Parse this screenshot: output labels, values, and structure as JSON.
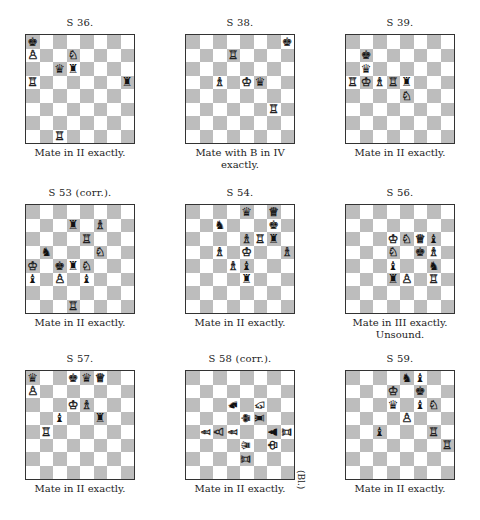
{
  "problems": [
    {
      "id": "s36",
      "title": "S 36.",
      "caption": [
        "Mate in II exactly."
      ],
      "pieces": [
        {
          "sq": "a8",
          "color": "b",
          "type": "K"
        },
        {
          "sq": "a7",
          "color": "w",
          "type": "P"
        },
        {
          "sq": "d7",
          "color": "w",
          "type": "N"
        },
        {
          "sq": "c6",
          "color": "b",
          "type": "Q"
        },
        {
          "sq": "d6",
          "color": "b",
          "type": "R"
        },
        {
          "sq": "a5",
          "color": "w",
          "type": "R"
        },
        {
          "sq": "h5",
          "color": "b",
          "type": "R"
        },
        {
          "sq": "c1",
          "color": "w",
          "type": "R"
        }
      ]
    },
    {
      "id": "s38",
      "title": "S 38.",
      "caption": [
        "Mate with B in IV",
        "exactly."
      ],
      "pieces": [
        {
          "sq": "h8",
          "color": "b",
          "type": "K"
        },
        {
          "sq": "d7",
          "color": "w",
          "type": "R"
        },
        {
          "sq": "c5",
          "color": "w",
          "type": "B"
        },
        {
          "sq": "e5",
          "color": "w",
          "type": "K"
        },
        {
          "sq": "f5",
          "color": "b",
          "type": "Q"
        },
        {
          "sq": "g3",
          "color": "w",
          "type": "R"
        }
      ]
    },
    {
      "id": "s39",
      "title": "S 39.",
      "caption": [
        "Mate in II exactly."
      ],
      "pieces": [
        {
          "sq": "b7",
          "color": "b",
          "type": "K"
        },
        {
          "sq": "b6",
          "color": "b",
          "type": "Q"
        },
        {
          "sq": "a5",
          "color": "w",
          "type": "R"
        },
        {
          "sq": "b5",
          "color": "w",
          "type": "K"
        },
        {
          "sq": "c5",
          "color": "w",
          "type": "B"
        },
        {
          "sq": "d5",
          "color": "w",
          "type": "R"
        },
        {
          "sq": "e5",
          "color": "b",
          "type": "R"
        },
        {
          "sq": "e4",
          "color": "w",
          "type": "N"
        }
      ]
    },
    {
      "id": "s53",
      "title": "S 53 (corr.).",
      "caption": [
        "Mate in II exactly."
      ],
      "pieces": [
        {
          "sq": "d7",
          "color": "b",
          "type": "R"
        },
        {
          "sq": "f7",
          "color": "w",
          "type": "B"
        },
        {
          "sq": "e6",
          "color": "w",
          "type": "R"
        },
        {
          "sq": "b5",
          "color": "b",
          "type": "N"
        },
        {
          "sq": "f5",
          "color": "w",
          "type": "N"
        },
        {
          "sq": "a4",
          "color": "w",
          "type": "K"
        },
        {
          "sq": "c4",
          "color": "b",
          "type": "K"
        },
        {
          "sq": "d4",
          "color": "b",
          "type": "R"
        },
        {
          "sq": "e4",
          "color": "w",
          "type": "N"
        },
        {
          "sq": "a3",
          "color": "b",
          "type": "B"
        },
        {
          "sq": "c3",
          "color": "w",
          "type": "P"
        },
        {
          "sq": "e3",
          "color": "b",
          "type": "B"
        },
        {
          "sq": "d1",
          "color": "w",
          "type": "R"
        }
      ]
    },
    {
      "id": "s54",
      "title": "S 54.",
      "caption": [
        "Mate in II exactly."
      ],
      "pieces": [
        {
          "sq": "e8",
          "color": "b",
          "type": "Q"
        },
        {
          "sq": "g8",
          "color": "w",
          "type": "Q"
        },
        {
          "sq": "c7",
          "color": "b",
          "type": "N"
        },
        {
          "sq": "g7",
          "color": "b",
          "type": "K"
        },
        {
          "sq": "e6",
          "color": "w",
          "type": "B"
        },
        {
          "sq": "f6",
          "color": "w",
          "type": "R"
        },
        {
          "sq": "g6",
          "color": "b",
          "type": "R"
        },
        {
          "sq": "c5",
          "color": "w",
          "type": "B"
        },
        {
          "sq": "e5",
          "color": "w",
          "type": "K"
        },
        {
          "sq": "h5",
          "color": "w",
          "type": "B"
        },
        {
          "sq": "d4",
          "color": "w",
          "type": "B"
        },
        {
          "sq": "e4",
          "color": "b",
          "type": "B"
        },
        {
          "sq": "e3",
          "color": "b",
          "type": "R"
        }
      ]
    },
    {
      "id": "s56",
      "title": "S 56.",
      "caption": [
        "Mate in III exactly.",
        "Unsound."
      ],
      "pieces": [
        {
          "sq": "d6",
          "color": "w",
          "type": "K"
        },
        {
          "sq": "e6",
          "color": "w",
          "type": "N"
        },
        {
          "sq": "f6",
          "color": "w",
          "type": "Q"
        },
        {
          "sq": "g6",
          "color": "b",
          "type": "B"
        },
        {
          "sq": "d5",
          "color": "w",
          "type": "N"
        },
        {
          "sq": "f5",
          "color": "b",
          "type": "K"
        },
        {
          "sq": "g5",
          "color": "w",
          "type": "B"
        },
        {
          "sq": "d4",
          "color": "b",
          "type": "B"
        },
        {
          "sq": "g4",
          "color": "b",
          "type": "N"
        },
        {
          "sq": "d3",
          "color": "b",
          "type": "R"
        },
        {
          "sq": "e3",
          "color": "w",
          "type": "P"
        },
        {
          "sq": "g3",
          "color": "w",
          "type": "R"
        }
      ]
    },
    {
      "id": "s57",
      "title": "S 57.",
      "caption": [
        "Mate in II exactly."
      ],
      "pieces": [
        {
          "sq": "a8",
          "color": "b",
          "type": "Q"
        },
        {
          "sq": "d8",
          "color": "b",
          "type": "K"
        },
        {
          "sq": "e8",
          "color": "b",
          "type": "Q"
        },
        {
          "sq": "f8",
          "color": "w",
          "type": "Q"
        },
        {
          "sq": "a7",
          "color": "w",
          "type": "P"
        },
        {
          "sq": "d6",
          "color": "w",
          "type": "K"
        },
        {
          "sq": "e6",
          "color": "w",
          "type": "B"
        },
        {
          "sq": "c5",
          "color": "b",
          "type": "B"
        },
        {
          "sq": "f5",
          "color": "b",
          "type": "R"
        },
        {
          "sq": "b4",
          "color": "w",
          "type": "R"
        }
      ]
    },
    {
      "id": "s58",
      "title": "S 58 (corr.).",
      "caption": [
        "Mate in II exactly."
      ],
      "side_label": "(Bl.)",
      "rotated": true,
      "pieces": [
        {
          "sq": "d6",
          "color": "b",
          "type": "N"
        },
        {
          "sq": "f6",
          "color": "w",
          "type": "N"
        },
        {
          "sq": "e5",
          "color": "b",
          "type": "K"
        },
        {
          "sq": "f5",
          "color": "b",
          "type": "R"
        },
        {
          "sq": "b4",
          "color": "w",
          "type": "B"
        },
        {
          "sq": "c4",
          "color": "w",
          "type": "P"
        },
        {
          "sq": "d4",
          "color": "w",
          "type": "B"
        },
        {
          "sq": "g4",
          "color": "b",
          "type": "P"
        },
        {
          "sq": "h4",
          "color": "w",
          "type": "R"
        },
        {
          "sq": "e3",
          "color": "b",
          "type": "Q"
        },
        {
          "sq": "g3",
          "color": "w",
          "type": "K"
        },
        {
          "sq": "e2",
          "color": "w",
          "type": "R"
        }
      ]
    },
    {
      "id": "s59",
      "title": "S 59.",
      "caption": [
        "Mate in II exactly."
      ],
      "pieces": [
        {
          "sq": "e8",
          "color": "b",
          "type": "N"
        },
        {
          "sq": "f8",
          "color": "b",
          "type": "B"
        },
        {
          "sq": "d7",
          "color": "w",
          "type": "K"
        },
        {
          "sq": "f7",
          "color": "b",
          "type": "K"
        },
        {
          "sq": "d6",
          "color": "b",
          "type": "Q"
        },
        {
          "sq": "f6",
          "color": "b",
          "type": "B"
        },
        {
          "sq": "g6",
          "color": "w",
          "type": "N"
        },
        {
          "sq": "e5",
          "color": "w",
          "type": "P"
        },
        {
          "sq": "c4",
          "color": "b",
          "type": "B"
        },
        {
          "sq": "g4",
          "color": "w",
          "type": "R"
        },
        {
          "sq": "h3",
          "color": "w",
          "type": "R"
        }
      ]
    }
  ],
  "glyphs": {
    "w": {
      "K": "♔",
      "Q": "♕",
      "R": "♖",
      "B": "♗",
      "N": "♘",
      "P": "♙"
    },
    "b": {
      "K": "♚",
      "Q": "♛",
      "R": "♜",
      "B": "♝",
      "N": "♞",
      "P": "♟"
    }
  },
  "piece_names": {
    "K": "king",
    "Q": "queen",
    "R": "rook",
    "B": "bishop",
    "N": "knight",
    "P": "pawn"
  }
}
